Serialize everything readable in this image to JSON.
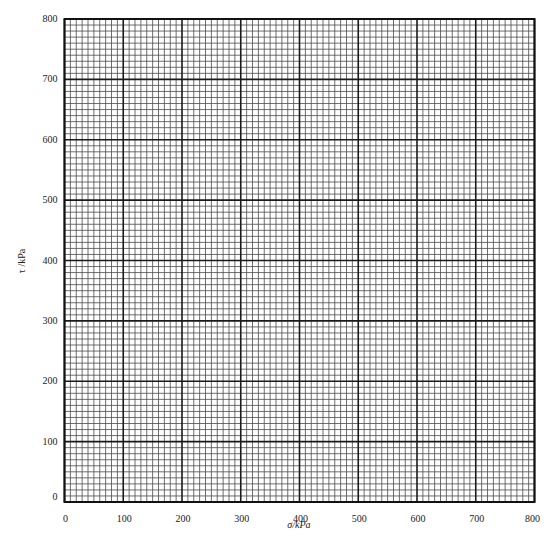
{
  "chart_data": {
    "type": "scatter",
    "title": "",
    "xlabel": "σ/kPa",
    "ylabel": "τ /kPa",
    "xlim": [
      0,
      800
    ],
    "ylim": [
      0,
      800
    ],
    "x_ticks": [
      0,
      100,
      200,
      300,
      400,
      500,
      600,
      700,
      800
    ],
    "y_ticks": [
      0,
      100,
      200,
      300,
      400,
      500,
      600,
      700,
      800
    ],
    "grid": true,
    "major_step": 100,
    "minor_divisions": 10,
    "series": [],
    "legend": null
  },
  "colors": {
    "background": "#ffffff",
    "major_grid": "#1a1a1a",
    "minor_grid": "#4a4a4a",
    "text": "#222222"
  },
  "layout": {
    "plot_left": 64.5,
    "plot_top": 19,
    "plot_right": 534.5,
    "plot_bottom": 502
  }
}
